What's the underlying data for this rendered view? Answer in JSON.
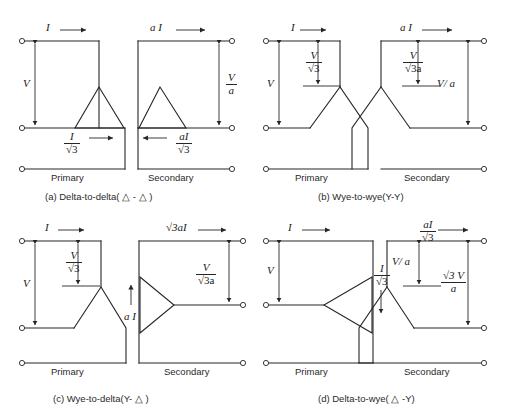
{
  "figure": {
    "background_color": "#ffffff",
    "line_color": "#262626",
    "panel_count": 4
  },
  "panels": [
    {
      "id": "a",
      "caption": "(a) Delta-to-delta( △ - △ )",
      "connection": "Delta-to-delta",
      "symbol": "△ - △",
      "primary": {
        "side_label": "Primary",
        "winding_shape": "delta",
        "line_current": "I",
        "line_current_arrow": "right",
        "phase_current_num": "I",
        "phase_current_den": "√3",
        "phase_current_arrow": "right",
        "line_voltage": "V"
      },
      "secondary": {
        "side_label": "Secondary",
        "winding_shape": "delta",
        "line_current": "a I",
        "line_current_arrow": "right",
        "phase_current_num": "aI",
        "phase_current_den": "√3",
        "phase_current_arrow": "left",
        "line_voltage_num": "V",
        "line_voltage_den": "a"
      }
    },
    {
      "id": "b",
      "caption": "(b) Wye-to-wye(Y-Y)",
      "connection": "Wye-to-wye",
      "symbol": "Y-Y",
      "primary": {
        "side_label": "Primary",
        "winding_shape": "wye",
        "line_current": "I",
        "line_current_arrow": "right",
        "line_voltage": "V",
        "phase_voltage_num": "V",
        "phase_voltage_den": "√3"
      },
      "secondary": {
        "side_label": "Secondary",
        "winding_shape": "wye",
        "line_current": "a I",
        "line_current_arrow": "right",
        "line_voltage": "V/ a",
        "phase_voltage_num": "V",
        "phase_voltage_den": "√3a"
      }
    },
    {
      "id": "c",
      "caption": "(c) Wye-to-delta(Y- △ )",
      "connection": "Wye-to-delta",
      "symbol": "Y- △",
      "primary": {
        "side_label": "Primary",
        "winding_shape": "wye",
        "line_current": "I",
        "line_current_arrow": "right",
        "line_voltage": "V",
        "phase_voltage_num": "V",
        "phase_voltage_den": "√3"
      },
      "secondary": {
        "side_label": "Secondary",
        "winding_shape": "delta",
        "line_current": "√3aI",
        "line_current_arrow": "right",
        "phase_current": "a I",
        "phase_current_arrow": "up",
        "line_voltage_num": "V",
        "line_voltage_den": "√3a"
      }
    },
    {
      "id": "d",
      "caption": "(d) Delta-to-wye( △ -Y)",
      "connection": "Delta-to-wye",
      "symbol": "△ -Y",
      "primary": {
        "side_label": "Primary",
        "winding_shape": "delta",
        "line_current": "I",
        "line_current_arrow": "right",
        "line_voltage": "V",
        "phase_current_num": "I",
        "phase_current_den": "√3",
        "phase_current_arrow": "down"
      },
      "secondary": {
        "side_label": "Secondary",
        "winding_shape": "wye",
        "line_current_num": "aI",
        "line_current_den": "√3",
        "line_current_arrow": "right",
        "phase_voltage": "V/ a",
        "line_voltage_num": "√3 V",
        "line_voltage_den": "a"
      }
    }
  ]
}
